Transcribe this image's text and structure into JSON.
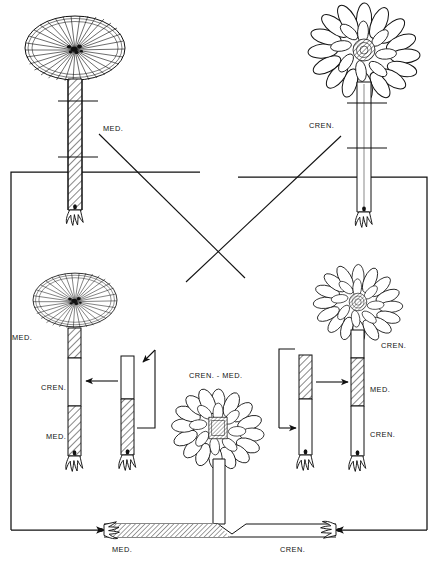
{
  "figure": {
    "type": "biology-diagram",
    "background_color": "#ffffff",
    "line_color": "#111111",
    "hatch_meaning": "hatched = mediterranea (MED.) tissue; plain/open = crenulata (CREN.) tissue"
  },
  "species": {
    "med_abbrev": "MED.",
    "cren_abbrev": "CREN.",
    "hybrid_abbrev": "CREN. - MED."
  },
  "panels": {
    "parent_left": {
      "name": "parent-mediterranea",
      "cap_type": "smooth-rayed-disc",
      "stalk_fill": "hatched",
      "label": "MED.",
      "cut_marks": 2
    },
    "parent_right": {
      "name": "parent-crenulata",
      "cap_type": "lobed-petal-disc",
      "stalk_fill": "plain",
      "label": "CREN.",
      "cut_marks": 2
    },
    "graft_left": {
      "name": "graft-med-cren-med",
      "cap_type": "smooth-rayed-disc",
      "segments": [
        {
          "label": "MED.",
          "fill": "hatched"
        },
        {
          "label": "CREN.",
          "fill": "plain"
        },
        {
          "label": "MED.",
          "fill": "hatched"
        }
      ],
      "labels": [
        "MED.",
        "CREN.",
        "MED."
      ]
    },
    "graft_right": {
      "name": "graft-cren-med-cren",
      "cap_type": "lobed-petal-disc",
      "segments": [
        {
          "label": "CREN.",
          "fill": "plain"
        },
        {
          "label": "MED.",
          "fill": "hatched"
        },
        {
          "label": "CREN.",
          "fill": "plain"
        }
      ],
      "labels": [
        "CREN.",
        "MED.",
        "CREN."
      ]
    },
    "piece_left": {
      "name": "stalk-piece-cren-over-med",
      "top_fill": "plain",
      "bottom_fill": "hatched",
      "has_rhizoid": true
    },
    "piece_right": {
      "name": "stalk-piece-med-over-cren",
      "top_fill": "hatched",
      "bottom_fill": "plain",
      "has_rhizoid": true
    },
    "hybrid_bottom": {
      "name": "hybrid-regenerate",
      "cap_label": "CREN. - MED.",
      "cap_type": "lobed-disc-with-hatched-center",
      "base_left_label": "MED.",
      "base_left_fill": "hatched",
      "base_right_label": "CREN.",
      "base_right_fill": "plain"
    }
  },
  "labels": {
    "top_left": "MED.",
    "top_right": "CREN.",
    "mid_left_top": "MED.",
    "mid_left_middle": "CREN.",
    "mid_left_bottom": "MED.",
    "mid_right_top": "CREN.",
    "mid_right_middle": "MED.",
    "mid_right_bottom": "CREN.",
    "hybrid_cap": "CREN. - MED.",
    "bottom_left": "MED.",
    "bottom_right": "CREN."
  }
}
